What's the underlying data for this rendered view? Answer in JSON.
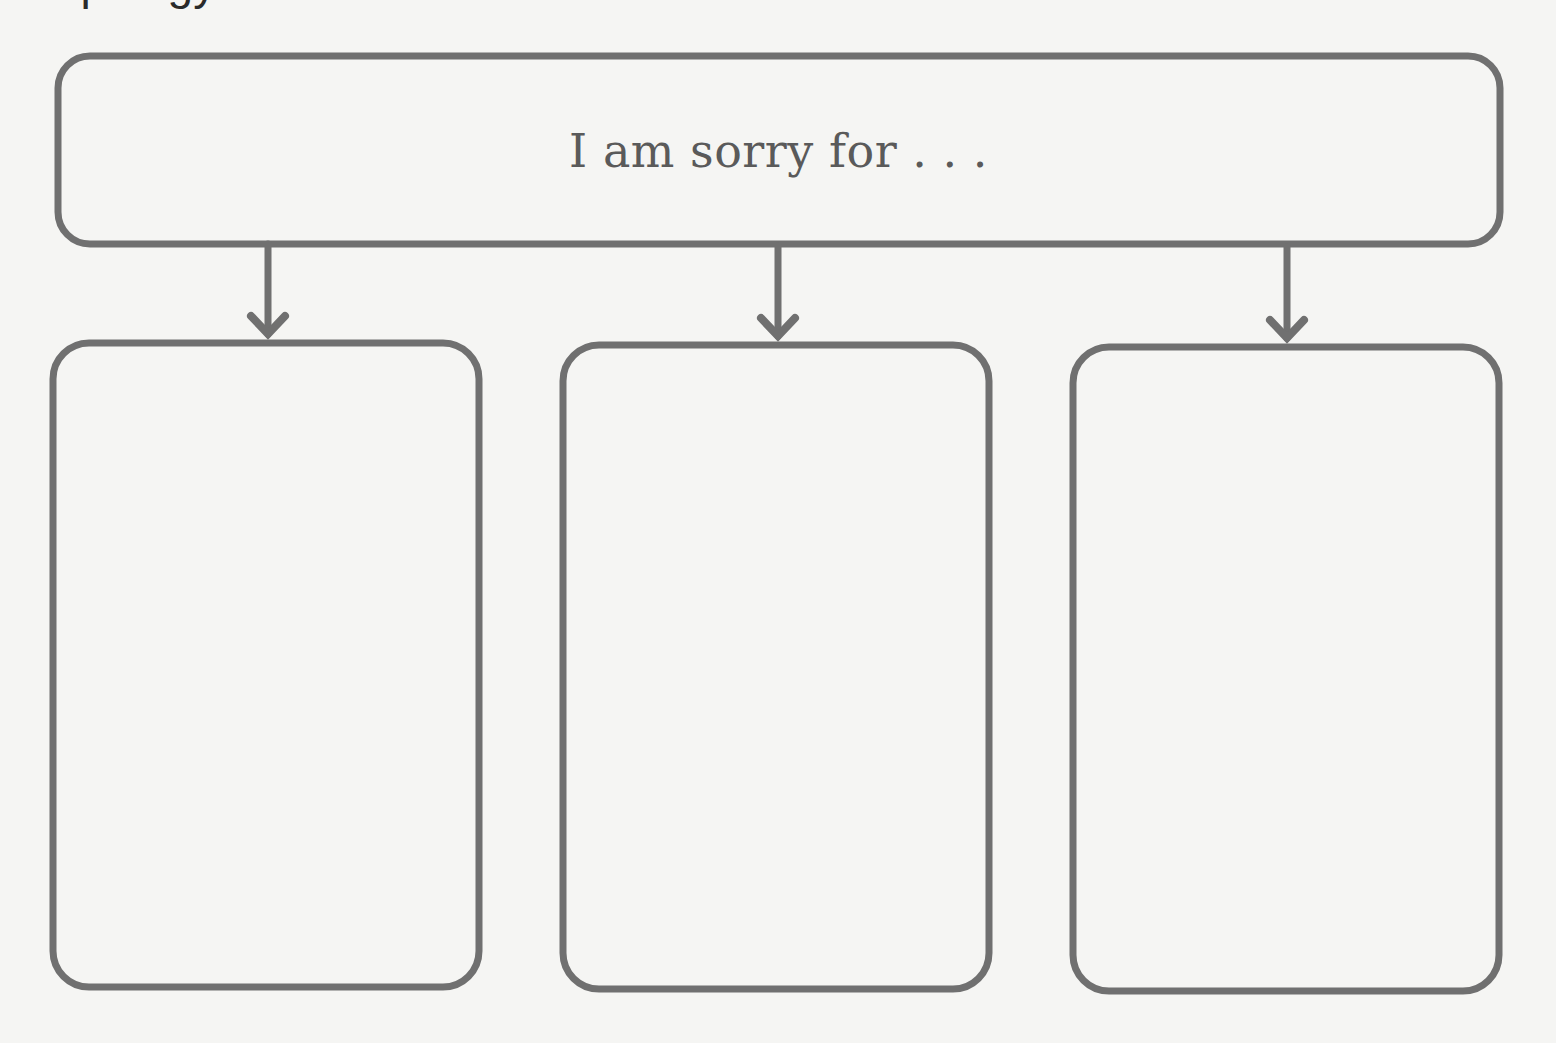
{
  "page": {
    "clipped_top_text": "apology"
  },
  "header": {
    "prompt": "I am sorry for . . ."
  },
  "colors": {
    "background": "#f5f5f3",
    "stroke": "#707070",
    "text": "#5a5a5a"
  },
  "answer_boxes": [
    {
      "label": "",
      "content": ""
    },
    {
      "label": "",
      "content": ""
    },
    {
      "label": "",
      "content": ""
    }
  ]
}
